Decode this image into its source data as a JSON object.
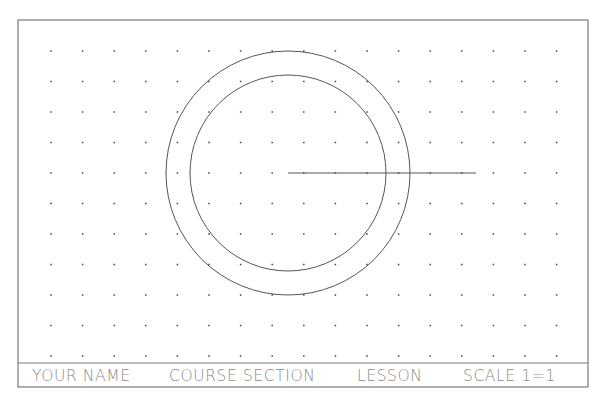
{
  "sheet": {
    "border": {
      "x": 18,
      "y": 20,
      "width": 570,
      "height": 367,
      "color": "#7a7a7a"
    },
    "title_block_divider_y": 363
  },
  "grid": {
    "origin_x": 51,
    "origin_y": 51,
    "spacing_x": 31.6,
    "spacing_y": 30.5,
    "columns": 17,
    "rows": 11,
    "dot_color": "#444444"
  },
  "geometry": {
    "outer_circle": {
      "cx": 288,
      "cy": 173,
      "r": 122
    },
    "inner_circle": {
      "cx": 288,
      "cy": 173,
      "r": 98
    },
    "line": {
      "x1": 288,
      "y1": 173,
      "x2": 476,
      "y2": 173
    },
    "stroke_color": "#555555"
  },
  "title_block": {
    "fields": [
      {
        "label": "YOUR NAME",
        "x": 32
      },
      {
        "label": "COURSE SECTION",
        "x": 169
      },
      {
        "label": "LESSON",
        "x": 357
      },
      {
        "label": "SCALE 1=1",
        "x": 463
      }
    ],
    "baseline_y": 381
  }
}
